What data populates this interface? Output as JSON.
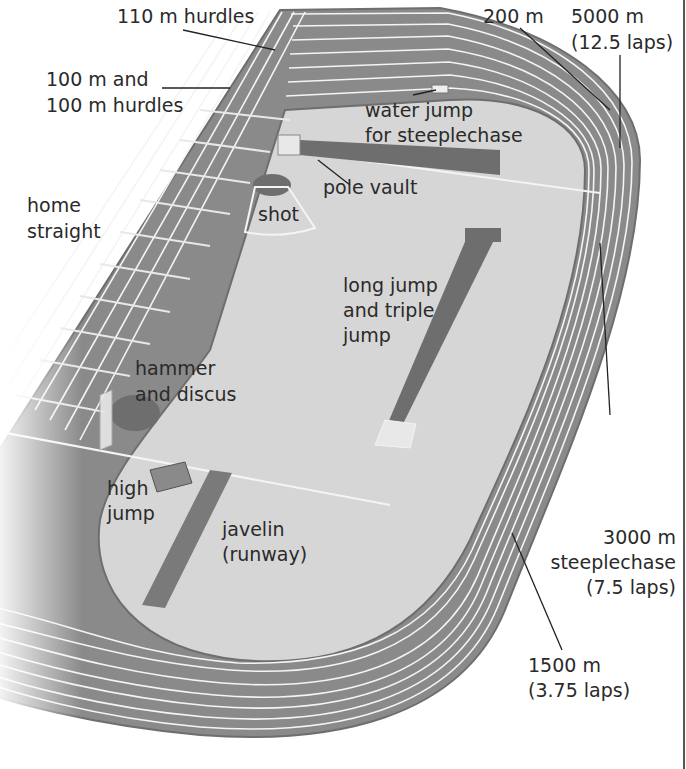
{
  "diagram": {
    "colors": {
      "track": "#8a8a8a",
      "track_edge": "#6e6e6e",
      "infield": "#d6d6d6",
      "lane_lines": "#f4f4f4",
      "runway": "#7a7a7a",
      "text": "#2a2a2a",
      "background": "#ffffff"
    },
    "lanes": 8,
    "labels": {
      "hurdles_110": "110 m hurdles",
      "hurdles_100_line1": "100 m and",
      "hurdles_100_line2": "100 m hurdles",
      "home_line1": "home",
      "home_line2": "straight",
      "m200": "200 m",
      "m5000_line1": "5000 m",
      "m5000_line2": "(12.5 laps)",
      "water_line1": "water jump",
      "water_line2": "for steeplechase",
      "pole_vault": "pole vault",
      "shot": "shot",
      "long_line1": "long jump",
      "long_line2": "and triple",
      "long_line3": "jump",
      "hammer_line1": "hammer",
      "hammer_line2": "and discus",
      "high_line1": "high",
      "high_line2": "jump",
      "javelin_line1": "javelin",
      "javelin_line2": "(runway)",
      "steeple_line1": "3000 m",
      "steeple_line2": "steeplechase",
      "steeple_line3": "(7.5 laps)",
      "m1500_line1": "1500 m",
      "m1500_line2": "(3.75 laps)"
    }
  }
}
